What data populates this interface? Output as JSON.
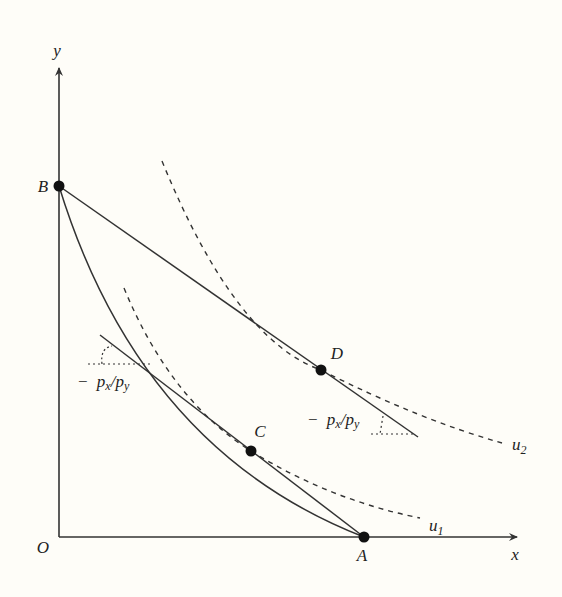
{
  "diagram": {
    "type": "economics-indifference-curves",
    "axes": {
      "y_label": "y",
      "x_label": "x",
      "origin_label": "O"
    },
    "points": {
      "A": "A",
      "B": "B",
      "C": "C",
      "D": "D"
    },
    "curves": {
      "u1": "u",
      "u1_sub": "1",
      "u2": "u",
      "u2_sub": "2"
    },
    "slope_labels": {
      "left": {
        "minus": "−",
        "px": "p",
        "px_sub": "x",
        "slash": "/",
        "py": "p",
        "py_sub": "y"
      },
      "right": {
        "minus": "−",
        "px": "p",
        "px_sub": "x",
        "slash": "/",
        "py": "p",
        "py_sub": "y"
      }
    },
    "colors": {
      "ink": "#222222",
      "background": "#fefdf8"
    }
  }
}
